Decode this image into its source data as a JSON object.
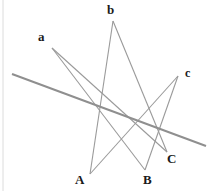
{
  "figure": {
    "width": 209,
    "height": 191,
    "background_color": "#ffffff",
    "circle": {
      "name": "conic-circle",
      "center_x": 106.5,
      "center_y": 98,
      "radius": 77,
      "stroke_color": "#0d0d0d",
      "stroke_width": 2.6
    },
    "chord_color": "#9a9a9a",
    "chord_width": 1.1,
    "pascal_line_color": "#8f8f8f",
    "pascal_line_width": 2.0,
    "margin_rule_color": "#dcdcdc"
  },
  "points": [
    {
      "id": "a",
      "label": "a",
      "cx": 52,
      "cy": 48,
      "label_x": 38,
      "label_y": 30,
      "font_size": 13
    },
    {
      "id": "b",
      "label": "b",
      "cx": 113,
      "cy": 21,
      "label_x": 107,
      "label_y": 3,
      "font_size": 13
    },
    {
      "id": "c",
      "label": "c",
      "cx": 178,
      "cy": 76,
      "label_x": 185,
      "label_y": 67,
      "font_size": 12
    },
    {
      "id": "A",
      "label": "A",
      "cx": 90,
      "cy": 174,
      "label_x": 75,
      "label_y": 173,
      "font_size": 13
    },
    {
      "id": "B",
      "label": "B",
      "cx": 145,
      "cy": 170,
      "label_x": 143,
      "label_y": 173,
      "font_size": 13
    },
    {
      "id": "C",
      "label": "C",
      "cx": 167,
      "cy": 152,
      "label_x": 167,
      "label_y": 152,
      "font_size": 13
    }
  ],
  "chords": [
    {
      "id": "a-B",
      "from": "a",
      "to": "B",
      "x1": 52,
      "y1": 48,
      "x2": 145,
      "y2": 170
    },
    {
      "id": "a-C",
      "from": "a",
      "to": "C",
      "x1": 52,
      "y1": 48,
      "x2": 167,
      "y2": 152
    },
    {
      "id": "b-A",
      "from": "b",
      "to": "A",
      "x1": 113,
      "y1": 21,
      "x2": 90,
      "y2": 174
    },
    {
      "id": "b-C",
      "from": "b",
      "to": "C",
      "x1": 113,
      "y1": 21,
      "x2": 167,
      "y2": 152
    },
    {
      "id": "c-A",
      "from": "c",
      "to": "A",
      "x1": 178,
      "y1": 76,
      "x2": 90,
      "y2": 174
    },
    {
      "id": "c-B",
      "from": "c",
      "to": "B",
      "x1": 178,
      "y1": 76,
      "x2": 145,
      "y2": 170
    }
  ],
  "pascal_line": {
    "id": "pascal-line",
    "x1": 12,
    "y1": 74,
    "x2": 206,
    "y2": 146
  },
  "margin_rule": {
    "id": "left-margin-rule",
    "x1": 3,
    "y1": 0,
    "x2": 3,
    "y2": 191
  }
}
